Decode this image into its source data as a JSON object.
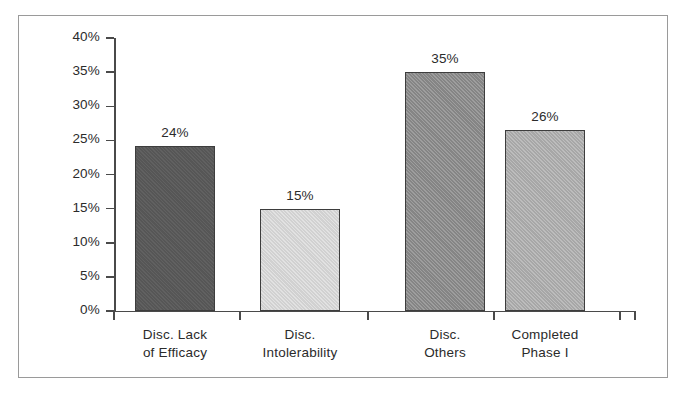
{
  "chart_data": {
    "type": "bar",
    "title": "",
    "xlabel": "",
    "ylabel": "",
    "ylim": [
      0,
      40
    ],
    "y_unit": "%",
    "grid": false,
    "legend": "none",
    "y_ticks": [
      "0%",
      "5%",
      "10%",
      "15%",
      "20%",
      "25%",
      "30%",
      "35%",
      "40%"
    ],
    "y_tick_values": [
      0,
      5,
      10,
      15,
      20,
      25,
      30,
      35,
      40
    ],
    "categories": [
      "Disc. Lack of Efficacy",
      "Disc. Intolerability",
      "Disc. Others",
      "Completed Phase I"
    ],
    "category_lines": [
      [
        "Disc. Lack",
        "of Efficacy"
      ],
      [
        "Disc.",
        "Intolerability"
      ],
      [
        "Disc.",
        "Others"
      ],
      [
        "Completed",
        "Phase I"
      ]
    ],
    "values": [
      24,
      15,
      35,
      26
    ],
    "plotted_values": [
      24.2,
      15.0,
      35.0,
      26.5
    ],
    "data_labels": [
      "24%",
      "15%",
      "35%",
      "26%"
    ],
    "bar_colors": [
      "#595959",
      "#dcdcdc",
      "#8c8c8c",
      "#b0b0b0"
    ],
    "bar_edge_color": "#3d3d3d",
    "axis_color": "#4a4a4a",
    "frame_color": "#9a9a9a",
    "background_color": "#ffffff"
  }
}
